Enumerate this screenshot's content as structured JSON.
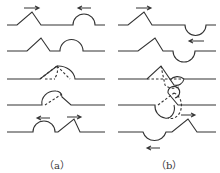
{
  "figure": {
    "panels": [
      {
        "id": "a",
        "label": "（a）",
        "description": "triangular pulse and upright semicircular pulse approach, overlap and pass through each other"
      },
      {
        "id": "b",
        "label": "（b）",
        "description": "triangular pulse and inverted semicircular pulse approach, overlap and pass through each other"
      }
    ],
    "colors": {
      "line": "#333333",
      "background": "#ffffff"
    }
  }
}
